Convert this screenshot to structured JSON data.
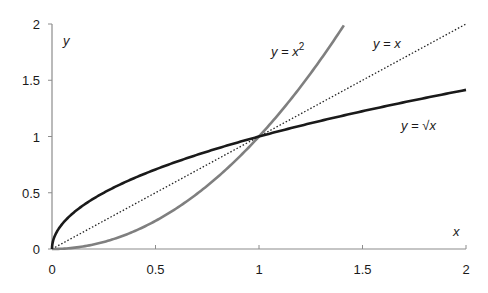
{
  "chart_data": {
    "type": "line",
    "title": "",
    "xlabel": "x",
    "ylabel": "y",
    "xlim": [
      0,
      2
    ],
    "ylim": [
      0,
      2
    ],
    "grid": false,
    "legend": "inline labels",
    "x_ticks": [
      "0",
      "0.5",
      "1",
      "1.5",
      "2"
    ],
    "y_ticks": [
      "0",
      "0.5",
      "1",
      "1.5",
      "2"
    ],
    "series": [
      {
        "name": "y = x²",
        "function": "x^2",
        "color": "#7f7f7f",
        "style": "solid",
        "x": [
          0,
          0.25,
          0.5,
          0.75,
          1,
          1.25,
          1.414
        ],
        "values": [
          0,
          0.0625,
          0.25,
          0.5625,
          1,
          1.5625,
          2
        ]
      },
      {
        "name": "y = x",
        "function": "x",
        "color": "#222222",
        "style": "dotted",
        "x": [
          0,
          0.5,
          1,
          1.5,
          2
        ],
        "values": [
          0,
          0.5,
          1,
          1.5,
          2
        ]
      },
      {
        "name": "y = √x",
        "function": "sqrt(x)",
        "color": "#1a1a1a",
        "style": "solid",
        "x": [
          0,
          0.25,
          0.5,
          0.75,
          1,
          1.25,
          1.5,
          1.75,
          2
        ],
        "values": [
          0,
          0.5,
          0.707,
          0.866,
          1,
          1.118,
          1.225,
          1.323,
          1.414
        ]
      }
    ],
    "annotations": [
      {
        "text": "y = x",
        "sup": "2",
        "x": 1.03,
        "y": 1.8
      },
      {
        "text": "y = x",
        "sup": "",
        "x": 1.45,
        "y": 1.85
      },
      {
        "text": "y = √x",
        "sup": "",
        "x": 1.67,
        "y": 1.07
      }
    ]
  },
  "labels": {
    "x_axis": "x",
    "y_axis": "y",
    "series_x2_prefix": "y = x",
    "series_x2_sup": "2",
    "series_x": "y = x",
    "series_sqrt": "y = √x"
  }
}
